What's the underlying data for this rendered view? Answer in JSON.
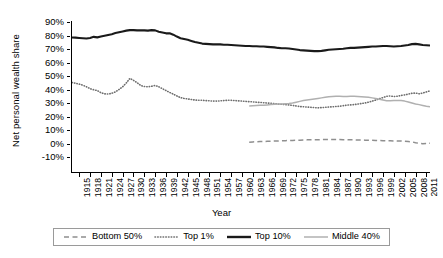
{
  "chart_data": {
    "type": "line",
    "title": "",
    "xlabel": "Year",
    "ylabel": "Net personal wealth share",
    "xlim": [
      1913,
      2012
    ],
    "ylim": [
      -0.1,
      0.9
    ],
    "grid": false,
    "legend_position": "bottom",
    "y_tick_labels": [
      "90%",
      "80%",
      "70%",
      "60%",
      "50%",
      "40%",
      "30%",
      "20%",
      "10%",
      "0%",
      "-10%"
    ],
    "y_tick_values": [
      0.9,
      0.8,
      0.7,
      0.6,
      0.5,
      0.4,
      0.3,
      0.2,
      0.1,
      0.0,
      -0.1
    ],
    "x_tick_labels": [
      "1915",
      "1918",
      "1921",
      "1924",
      "1927",
      "1930",
      "1933",
      "1936",
      "1939",
      "1942",
      "1945",
      "1948",
      "1951",
      "1954",
      "1957",
      "1960",
      "1963",
      "1966",
      "1969",
      "1972",
      "1975",
      "1978",
      "1981",
      "1984",
      "1987",
      "1990",
      "1993",
      "1996",
      "1999",
      "2002",
      "2005",
      "2008",
      "2011"
    ],
    "x_tick_values": [
      1915,
      1918,
      1921,
      1924,
      1927,
      1930,
      1933,
      1936,
      1939,
      1942,
      1945,
      1948,
      1951,
      1954,
      1957,
      1960,
      1963,
      1966,
      1969,
      1972,
      1975,
      1978,
      1981,
      1984,
      1987,
      1990,
      1993,
      1996,
      1999,
      2002,
      2005,
      2008,
      2011
    ],
    "series": [
      {
        "name": "Bottom 50%",
        "style": "dashed",
        "color": "#8f8f8f",
        "x": [
          1962,
          1963,
          1964,
          1965,
          1966,
          1967,
          1968,
          1969,
          1970,
          1971,
          1972,
          1973,
          1974,
          1975,
          1976,
          1977,
          1978,
          1979,
          1980,
          1981,
          1982,
          1983,
          1984,
          1985,
          1986,
          1987,
          1988,
          1989,
          1990,
          1991,
          1992,
          1993,
          1994,
          1995,
          1996,
          1997,
          1998,
          1999,
          2000,
          2001,
          2002,
          2003,
          2004,
          2005,
          2006,
          2007,
          2008,
          2009,
          2010,
          2011,
          2012
        ],
        "values": [
          0.01,
          0.012,
          0.013,
          0.014,
          0.015,
          0.016,
          0.017,
          0.018,
          0.019,
          0.02,
          0.021,
          0.022,
          0.023,
          0.024,
          0.025,
          0.026,
          0.027,
          0.027,
          0.028,
          0.028,
          0.029,
          0.03,
          0.03,
          0.03,
          0.029,
          0.029,
          0.028,
          0.028,
          0.027,
          0.027,
          0.026,
          0.026,
          0.025,
          0.025,
          0.024,
          0.023,
          0.022,
          0.021,
          0.02,
          0.02,
          0.019,
          0.018,
          0.018,
          0.017,
          0.015,
          0.012,
          0.006,
          0.001,
          -0.001,
          0.0,
          0.002
        ]
      },
      {
        "name": "Top 1%",
        "style": "dotted",
        "color": "#6e6e6e",
        "x": [
          1913,
          1914,
          1915,
          1916,
          1917,
          1918,
          1919,
          1920,
          1921,
          1922,
          1923,
          1924,
          1925,
          1926,
          1927,
          1928,
          1929,
          1930,
          1931,
          1932,
          1933,
          1934,
          1935,
          1936,
          1937,
          1938,
          1939,
          1940,
          1941,
          1942,
          1943,
          1944,
          1945,
          1946,
          1947,
          1948,
          1949,
          1950,
          1951,
          1952,
          1953,
          1954,
          1955,
          1956,
          1957,
          1958,
          1959,
          1960,
          1961,
          1962,
          1963,
          1964,
          1965,
          1966,
          1967,
          1968,
          1969,
          1970,
          1971,
          1972,
          1973,
          1974,
          1975,
          1976,
          1977,
          1978,
          1979,
          1980,
          1981,
          1982,
          1983,
          1984,
          1985,
          1986,
          1987,
          1988,
          1989,
          1990,
          1991,
          1992,
          1993,
          1994,
          1995,
          1996,
          1997,
          1998,
          1999,
          2000,
          2001,
          2002,
          2003,
          2004,
          2005,
          2006,
          2007,
          2008,
          2009,
          2010,
          2011,
          2012
        ],
        "values": [
          0.452,
          0.446,
          0.44,
          0.432,
          0.42,
          0.406,
          0.398,
          0.392,
          0.376,
          0.368,
          0.366,
          0.372,
          0.382,
          0.4,
          0.42,
          0.448,
          0.482,
          0.468,
          0.45,
          0.43,
          0.422,
          0.42,
          0.424,
          0.43,
          0.42,
          0.406,
          0.392,
          0.378,
          0.366,
          0.352,
          0.34,
          0.334,
          0.33,
          0.326,
          0.322,
          0.32,
          0.32,
          0.318,
          0.316,
          0.314,
          0.314,
          0.316,
          0.318,
          0.32,
          0.32,
          0.318,
          0.316,
          0.314,
          0.312,
          0.31,
          0.308,
          0.306,
          0.304,
          0.302,
          0.3,
          0.298,
          0.296,
          0.292,
          0.29,
          0.288,
          0.286,
          0.282,
          0.278,
          0.274,
          0.272,
          0.27,
          0.268,
          0.266,
          0.264,
          0.266,
          0.268,
          0.27,
          0.272,
          0.274,
          0.276,
          0.28,
          0.284,
          0.286,
          0.288,
          0.292,
          0.296,
          0.3,
          0.306,
          0.314,
          0.322,
          0.332,
          0.34,
          0.35,
          0.352,
          0.348,
          0.35,
          0.356,
          0.36,
          0.366,
          0.372,
          0.374,
          0.368,
          0.374,
          0.382,
          0.39
        ]
      },
      {
        "name": "Top 10%",
        "style": "solid",
        "color": "#1a1a1a",
        "x": [
          1913,
          1914,
          1915,
          1916,
          1917,
          1918,
          1919,
          1920,
          1921,
          1922,
          1923,
          1924,
          1925,
          1926,
          1927,
          1928,
          1929,
          1930,
          1931,
          1932,
          1933,
          1934,
          1935,
          1936,
          1937,
          1938,
          1939,
          1940,
          1941,
          1942,
          1943,
          1944,
          1945,
          1946,
          1947,
          1948,
          1949,
          1950,
          1951,
          1952,
          1953,
          1954,
          1955,
          1956,
          1957,
          1958,
          1959,
          1960,
          1961,
          1962,
          1963,
          1964,
          1965,
          1966,
          1967,
          1968,
          1969,
          1970,
          1971,
          1972,
          1973,
          1974,
          1975,
          1976,
          1977,
          1978,
          1979,
          1980,
          1981,
          1982,
          1983,
          1984,
          1985,
          1986,
          1987,
          1988,
          1989,
          1990,
          1991,
          1992,
          1993,
          1994,
          1995,
          1996,
          1997,
          1998,
          1999,
          2000,
          2001,
          2002,
          2003,
          2004,
          2005,
          2006,
          2007,
          2008,
          2009,
          2010,
          2011,
          2012
        ],
        "values": [
          0.785,
          0.784,
          0.782,
          0.78,
          0.778,
          0.782,
          0.79,
          0.786,
          0.792,
          0.798,
          0.804,
          0.81,
          0.818,
          0.824,
          0.83,
          0.836,
          0.84,
          0.84,
          0.838,
          0.838,
          0.838,
          0.836,
          0.84,
          0.838,
          0.828,
          0.822,
          0.816,
          0.816,
          0.806,
          0.792,
          0.78,
          0.774,
          0.768,
          0.76,
          0.752,
          0.746,
          0.74,
          0.738,
          0.736,
          0.734,
          0.734,
          0.734,
          0.732,
          0.732,
          0.73,
          0.728,
          0.726,
          0.724,
          0.722,
          0.722,
          0.72,
          0.72,
          0.718,
          0.718,
          0.716,
          0.714,
          0.712,
          0.708,
          0.706,
          0.706,
          0.704,
          0.7,
          0.696,
          0.692,
          0.69,
          0.688,
          0.686,
          0.684,
          0.684,
          0.686,
          0.69,
          0.694,
          0.696,
          0.698,
          0.7,
          0.702,
          0.706,
          0.708,
          0.708,
          0.71,
          0.712,
          0.714,
          0.716,
          0.718,
          0.718,
          0.72,
          0.722,
          0.722,
          0.72,
          0.718,
          0.72,
          0.722,
          0.726,
          0.73,
          0.736,
          0.738,
          0.734,
          0.73,
          0.728,
          0.726
        ]
      },
      {
        "name": "Middle 40%",
        "style": "solid-light",
        "color": "#b0b0b0",
        "x": [
          1962,
          1963,
          1964,
          1965,
          1966,
          1967,
          1968,
          1969,
          1970,
          1971,
          1972,
          1973,
          1974,
          1975,
          1976,
          1977,
          1978,
          1979,
          1980,
          1981,
          1982,
          1983,
          1984,
          1985,
          1986,
          1987,
          1988,
          1989,
          1990,
          1991,
          1992,
          1993,
          1994,
          1995,
          1996,
          1997,
          1998,
          1999,
          2000,
          2001,
          2002,
          2003,
          2004,
          2005,
          2006,
          2007,
          2008,
          2009,
          2010,
          2011,
          2012
        ],
        "values": [
          0.278,
          0.28,
          0.282,
          0.283,
          0.284,
          0.286,
          0.288,
          0.29,
          0.292,
          0.292,
          0.294,
          0.296,
          0.3,
          0.306,
          0.312,
          0.318,
          0.322,
          0.326,
          0.33,
          0.334,
          0.338,
          0.342,
          0.346,
          0.348,
          0.35,
          0.35,
          0.348,
          0.348,
          0.35,
          0.35,
          0.348,
          0.346,
          0.344,
          0.342,
          0.338,
          0.334,
          0.328,
          0.322,
          0.316,
          0.316,
          0.318,
          0.318,
          0.318,
          0.314,
          0.308,
          0.3,
          0.292,
          0.288,
          0.282,
          0.276,
          0.272
        ]
      }
    ]
  },
  "legend": {
    "items": [
      {
        "label": "Bottom 50%"
      },
      {
        "label": "Top 1%"
      },
      {
        "label": "Top 10%"
      },
      {
        "label": "Middle 40%"
      }
    ]
  }
}
